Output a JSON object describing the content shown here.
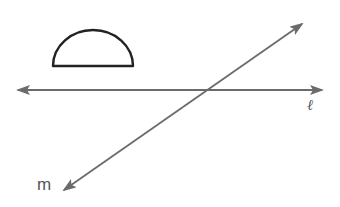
{
  "diagram": {
    "colors": {
      "line": "#6b6b6b",
      "shape_stroke": "#222222",
      "label": "#555555",
      "background": "#ffffff"
    },
    "shapes": [
      {
        "id": "semicircle",
        "type": "semicircle",
        "base_left": [
          53,
          66
        ],
        "base_right": [
          133,
          66
        ],
        "top": [
          93,
          30
        ]
      }
    ],
    "lines": [
      {
        "id": "l",
        "label": "ℓ",
        "from": [
          18,
          90
        ],
        "to": [
          322,
          90
        ],
        "arrows": "both",
        "label_position": [
          311,
          108
        ]
      },
      {
        "id": "m",
        "label": "m",
        "from": [
          64,
          190
        ],
        "to": [
          302,
          24
        ],
        "arrows": "both",
        "label_position": [
          38,
          190
        ]
      }
    ],
    "intersection": [
      201,
      89
    ]
  }
}
